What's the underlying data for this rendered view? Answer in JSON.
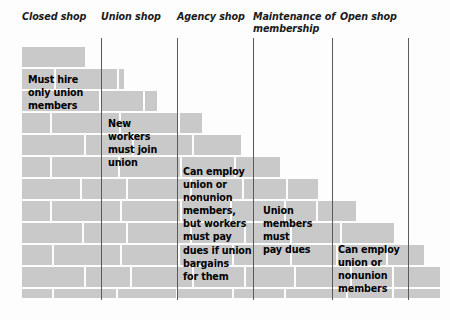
{
  "figure": {
    "type": "staircase-brick-diagram",
    "brick_color": "#c9c9c9",
    "rule_color": "#5a5a5a",
    "text_color": "#000000",
    "background_color": "#fdfdfd"
  },
  "columns": [
    {
      "id": "closed-shop",
      "label": "Closed shop"
    },
    {
      "id": "union-shop",
      "label": "Union shop"
    },
    {
      "id": "agency-shop",
      "label": "Agency shop"
    },
    {
      "id": "maintenance-of-membership",
      "label": "Maintenance of\nmembership"
    },
    {
      "id": "open-shop",
      "label": "Open shop"
    }
  ],
  "dividers": [
    {
      "id": "divider-1",
      "x": 101
    },
    {
      "id": "divider-2",
      "x": 177
    },
    {
      "id": "divider-3",
      "x": 253
    },
    {
      "id": "divider-4",
      "x": 332
    },
    {
      "id": "divider-5",
      "x": 408
    }
  ],
  "captions": [
    {
      "id": "caption-closed-shop",
      "column": "closed-shop",
      "text": "Must hire\nonly union\nmembers",
      "x": 28,
      "y": 73
    },
    {
      "id": "caption-union-shop",
      "column": "union-shop",
      "text": "New\nworkers\nmust join\nunion",
      "x": 108,
      "y": 117
    },
    {
      "id": "caption-agency-shop",
      "column": "agency-shop",
      "text": "Can employ\nunion or\nnonunion\nmembers,\nbut workers\nmust pay\ndues if union\nbargains\nfor them",
      "x": 183,
      "y": 165
    },
    {
      "id": "caption-maintenance-of-membership",
      "column": "maintenance-of-membership",
      "text": "Union\nmembers\nmust\npay dues",
      "x": 263,
      "y": 204
    },
    {
      "id": "caption-open-shop",
      "column": "open-shop",
      "text": "Can employ\nunion or\nnonunion\nmembers",
      "x": 338,
      "y": 243
    }
  ],
  "brick_rows": [
    {
      "row": 1,
      "y": 47,
      "h": 20,
      "right": 85,
      "bricks": [
        {
          "x": 22,
          "w": 63
        }
      ]
    },
    {
      "row": 2,
      "y": 69,
      "h": 20,
      "right": 124,
      "bricks": [
        {
          "x": 22,
          "w": 32
        },
        {
          "x": 56,
          "w": 61
        },
        {
          "x": 119,
          "w": 5
        }
      ]
    },
    {
      "row": 3,
      "y": 91,
      "h": 20,
      "right": 157,
      "bricks": [
        {
          "x": 22,
          "w": 77
        },
        {
          "x": 101,
          "w": 42
        },
        {
          "x": 145,
          "w": 12
        }
      ]
    },
    {
      "row": 4,
      "y": 113,
      "h": 20,
      "right": 202,
      "bricks": [
        {
          "x": 22,
          "w": 28
        },
        {
          "x": 52,
          "w": 67
        },
        {
          "x": 121,
          "w": 57
        },
        {
          "x": 180,
          "w": 22
        }
      ]
    },
    {
      "row": 5,
      "y": 135,
      "h": 20,
      "right": 241,
      "bricks": [
        {
          "x": 22,
          "w": 62
        },
        {
          "x": 86,
          "w": 46
        },
        {
          "x": 134,
          "w": 58
        },
        {
          "x": 194,
          "w": 47
        }
      ]
    },
    {
      "row": 6,
      "y": 157,
      "h": 20,
      "right": 280,
      "bricks": [
        {
          "x": 22,
          "w": 28
        },
        {
          "x": 52,
          "w": 66
        },
        {
          "x": 120,
          "w": 60
        },
        {
          "x": 182,
          "w": 52
        },
        {
          "x": 236,
          "w": 44
        }
      ]
    },
    {
      "row": 7,
      "y": 179,
      "h": 20,
      "right": 318,
      "bricks": [
        {
          "x": 22,
          "w": 58
        },
        {
          "x": 82,
          "w": 44
        },
        {
          "x": 128,
          "w": 62
        },
        {
          "x": 192,
          "w": 50
        },
        {
          "x": 244,
          "w": 42
        },
        {
          "x": 288,
          "w": 30
        }
      ]
    },
    {
      "row": 8,
      "y": 201,
      "h": 20,
      "right": 356,
      "bricks": [
        {
          "x": 22,
          "w": 28
        },
        {
          "x": 52,
          "w": 68
        },
        {
          "x": 122,
          "w": 58
        },
        {
          "x": 182,
          "w": 48
        },
        {
          "x": 232,
          "w": 52
        },
        {
          "x": 286,
          "w": 30
        },
        {
          "x": 318,
          "w": 38
        }
      ]
    },
    {
      "row": 9,
      "y": 223,
      "h": 20,
      "right": 394,
      "bricks": [
        {
          "x": 22,
          "w": 60
        },
        {
          "x": 84,
          "w": 42
        },
        {
          "x": 128,
          "w": 62
        },
        {
          "x": 192,
          "w": 52
        },
        {
          "x": 246,
          "w": 44
        },
        {
          "x": 292,
          "w": 48
        },
        {
          "x": 342,
          "w": 52
        }
      ]
    },
    {
      "row": 10,
      "y": 245,
      "h": 20,
      "right": 424,
      "bricks": [
        {
          "x": 22,
          "w": 30
        },
        {
          "x": 54,
          "w": 66
        },
        {
          "x": 122,
          "w": 56
        },
        {
          "x": 180,
          "w": 52
        },
        {
          "x": 234,
          "w": 56
        },
        {
          "x": 292,
          "w": 44
        },
        {
          "x": 338,
          "w": 48
        },
        {
          "x": 388,
          "w": 36
        }
      ]
    },
    {
      "row": 11,
      "y": 267,
      "h": 20,
      "right": 440,
      "bricks": [
        {
          "x": 22,
          "w": 62
        },
        {
          "x": 86,
          "w": 44
        },
        {
          "x": 132,
          "w": 60
        },
        {
          "x": 194,
          "w": 50
        },
        {
          "x": 246,
          "w": 48
        },
        {
          "x": 296,
          "w": 54
        },
        {
          "x": 352,
          "w": 40
        },
        {
          "x": 394,
          "w": 46
        }
      ]
    },
    {
      "row": 12,
      "y": 289,
      "h": 9,
      "right": 440,
      "bricks": [
        {
          "x": 22,
          "w": 30
        },
        {
          "x": 54,
          "w": 62
        },
        {
          "x": 118,
          "w": 58
        },
        {
          "x": 178,
          "w": 54
        },
        {
          "x": 234,
          "w": 50
        },
        {
          "x": 286,
          "w": 60
        },
        {
          "x": 348,
          "w": 44
        },
        {
          "x": 394,
          "w": 46
        }
      ]
    }
  ]
}
